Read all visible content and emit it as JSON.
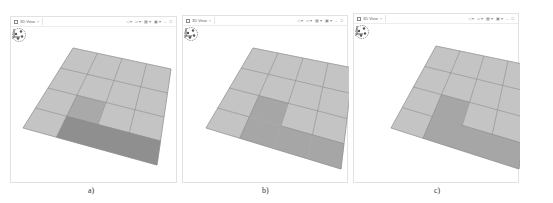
{
  "panels": [
    {
      "id": "a",
      "tab": {
        "label": "3D View",
        "close": "×"
      },
      "toolbar": [
        "◁ ▾",
        "▱ ▾",
        "▦ ▾",
        "▣ ▾",
        "–",
        "□"
      ],
      "caption": "a)",
      "grid": {
        "rows": 4,
        "cols": 4,
        "corners": {
          "tl": [
            62,
            21
          ],
          "tr": [
            160,
            42
          ],
          "br": [
            146,
            138
          ],
          "bl": [
            12,
            101
          ]
        },
        "cells_shading": [
          [
            "light",
            "light",
            "light",
            "light"
          ],
          [
            "light",
            "light",
            "light",
            "light"
          ],
          [
            "light",
            "medium",
            "light",
            "light"
          ],
          [
            "light",
            "dark",
            "dark",
            "dark"
          ]
        ],
        "merged_region": false,
        "internal_lines_in_region": true
      }
    },
    {
      "id": "b",
      "tab": {
        "label": "3D View",
        "close": "×"
      },
      "toolbar": [
        "◁ ▾",
        "▱ ▾",
        "▦ ▾",
        "▣ ▾",
        "–",
        "□"
      ],
      "caption": "b)",
      "grid": {
        "rows": 4,
        "cols": 4,
        "corners": {
          "tl": [
            70,
            22
          ],
          "tr": [
            170,
            42
          ],
          "br": [
            158,
            143
          ],
          "bl": [
            23,
            102
          ]
        },
        "cells_shading": [
          [
            "light",
            "light",
            "light",
            "light"
          ],
          [
            "light",
            "light",
            "light",
            "light"
          ],
          [
            "light",
            "merged",
            "light",
            "light"
          ],
          [
            "light",
            "merged",
            "merged",
            "merged"
          ]
        ],
        "merged_region": true,
        "internal_lines_in_region": false
      }
    },
    {
      "id": "c",
      "tab": {
        "label": "3D View",
        "close": "×"
      },
      "toolbar": [
        "◁ ▾",
        "▱ ▾",
        "▦ ▾",
        "▣ ▾",
        "–",
        "□"
      ],
      "caption": "c)",
      "grid": {
        "rows": 4,
        "cols": 4,
        "corners": {
          "tl": [
            82,
            22
          ],
          "tr": [
            178,
            42
          ],
          "br": [
            165,
            145
          ],
          "bl": [
            37,
            104
          ]
        },
        "cells_shading": [
          [
            "light",
            "light",
            "light",
            "light"
          ],
          [
            "light",
            "light",
            "light",
            "light"
          ],
          [
            "light",
            "merged",
            "light",
            "light"
          ],
          [
            "light",
            "merged",
            "merged",
            "merged"
          ]
        ],
        "merged_region": true,
        "internal_lines_in_region": true
      }
    }
  ],
  "colors": {
    "light": "#c4c4c4",
    "medium": "#a9a9a9",
    "dark": "#8f8f8f",
    "merged": "#a6a6a6",
    "grid_line": "#8a8a8a",
    "faint_line": "#9c9c9c"
  }
}
